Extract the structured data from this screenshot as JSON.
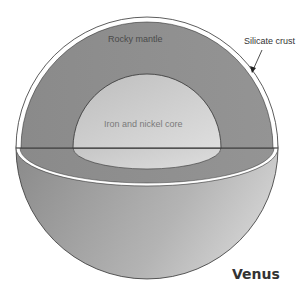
{
  "diagram": {
    "title": "Venus",
    "labels": {
      "mantle": "Rocky mantle",
      "core": "Iron and nickel core",
      "crust": "Silicate crust"
    },
    "colors": {
      "crust": "#ffffff",
      "mantle": "#8c8c8c",
      "core_light": "#d4d4d4",
      "core_dark": "#b8b8b8",
      "hemisphere_light": "#c8c8c8",
      "hemisphere_dark": "#8e8e8e",
      "outline": "#333333"
    }
  }
}
